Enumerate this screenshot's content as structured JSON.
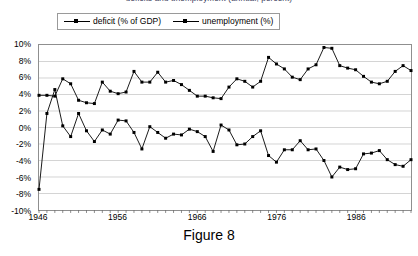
{
  "figure": {
    "title_cropped": "deficits and unemployment (annual, percent)",
    "caption": "Figure 8"
  },
  "legend": {
    "position": "top-left",
    "entries": [
      {
        "label": "deficit (% of GDP)",
        "color": "#000000",
        "marker": "square"
      },
      {
        "label": "unemployment (%)",
        "color": "#000000",
        "marker": "square"
      }
    ]
  },
  "axes": {
    "y_tick_labels": [
      "10%",
      "8%",
      "6%",
      "4%",
      "2%",
      "0%",
      "-2%",
      "-4%",
      "-6%",
      "-8%",
      "-10%"
    ],
    "x_tick_labels": [
      "1946",
      "1956",
      "1966",
      "1976",
      "1986"
    ]
  },
  "chart_data": {
    "type": "line",
    "title": "deficits and unemployment (annual, percent)",
    "xlabel": "",
    "ylabel": "",
    "xlim": [
      1946,
      1993
    ],
    "ylim": [
      -10,
      10
    ],
    "grid": true,
    "legend_position": "top-left",
    "x": [
      1946,
      1947,
      1948,
      1949,
      1950,
      1951,
      1952,
      1953,
      1954,
      1955,
      1956,
      1957,
      1958,
      1959,
      1960,
      1961,
      1962,
      1963,
      1964,
      1965,
      1966,
      1967,
      1968,
      1969,
      1970,
      1971,
      1972,
      1973,
      1974,
      1975,
      1976,
      1977,
      1978,
      1979,
      1980,
      1981,
      1982,
      1983,
      1984,
      1985,
      1986,
      1987,
      1988,
      1989,
      1990,
      1991,
      1992,
      1993
    ],
    "series": [
      {
        "name": "deficit (% of GDP)",
        "color": "#000000",
        "marker": "square",
        "values": [
          -7.5,
          1.7,
          4.6,
          0.2,
          -1.1,
          1.7,
          -0.4,
          -1.7,
          -0.3,
          -0.8,
          0.9,
          0.8,
          -0.6,
          -2.6,
          0.1,
          -0.6,
          -1.3,
          -0.8,
          -0.9,
          -0.2,
          -0.5,
          -1.1,
          -2.9,
          0.3,
          -0.3,
          -2.1,
          -2.0,
          -1.1,
          -0.4,
          -3.4,
          -4.2,
          -2.7,
          -2.7,
          -1.6,
          -2.7,
          -2.6,
          -4.0,
          -6.0,
          -4.8,
          -5.1,
          -5.0,
          -3.2,
          -3.1,
          -2.8,
          -3.9,
          -4.5,
          -4.7,
          -3.9
        ]
      },
      {
        "name": "unemployment (%)",
        "color": "#000000",
        "marker": "square",
        "values": [
          3.9,
          3.9,
          3.8,
          5.9,
          5.3,
          3.3,
          3.0,
          2.9,
          5.5,
          4.4,
          4.1,
          4.3,
          6.8,
          5.5,
          5.5,
          6.7,
          5.5,
          5.7,
          5.2,
          4.5,
          3.8,
          3.8,
          3.6,
          3.5,
          4.9,
          5.9,
          5.6,
          4.9,
          5.6,
          8.5,
          7.7,
          7.1,
          6.1,
          5.8,
          7.1,
          7.6,
          9.7,
          9.6,
          7.5,
          7.2,
          7.0,
          6.2,
          5.5,
          5.3,
          5.6,
          6.8,
          7.5,
          6.9
        ]
      }
    ]
  }
}
